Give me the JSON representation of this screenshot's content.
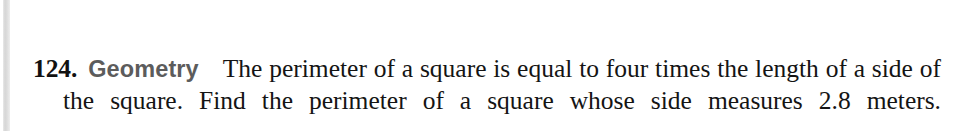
{
  "page": {
    "background_color": "#ffffff",
    "text_color": "#141414"
  },
  "scan_artifact": {
    "name": "left-edge-scan-bar",
    "color": "#d6d6d6"
  },
  "exercise": {
    "number": "124.",
    "topic_label": "Geometry",
    "topic_label_color": "#5c5c5c",
    "problem_text": "The perimeter of a square is equal to four times the length of a side of the square. Find the perimeter of a square whose side measures 2.8 meters.",
    "lines": [
      "124. Geometry    The perimeter of a square is equal to four times the length",
      "of a side of the square. Find the perimeter of a square whose side mea-",
      "sures 2.8 meters."
    ],
    "values_mentioned": {
      "side_length": "2.8",
      "side_length_unit": "meters",
      "multiplier": "four"
    }
  }
}
